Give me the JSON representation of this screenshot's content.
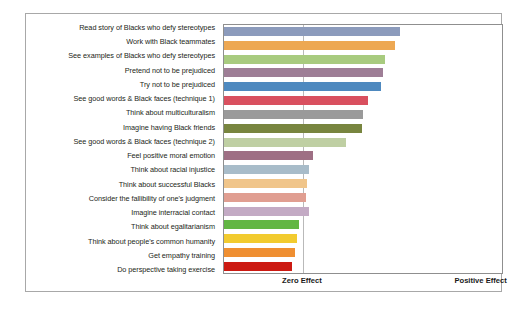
{
  "chart_data": {
    "type": "bar",
    "orientation": "horizontal",
    "title": "",
    "subtitle": "",
    "xlabel": "",
    "ylabel": "",
    "grid": false,
    "legend": null,
    "axis_tick_labels": [
      "Zero Effect",
      "Positive Effect"
    ],
    "axis_tick_positions_pct": [
      28.2,
      92.0
    ],
    "xlim_labels": [
      "Zero Effect",
      "Positive Effect"
    ],
    "zero_line_pct": 28.2,
    "categories": [
      "Read story of Blacks who defy stereotypes",
      "Work with Black teammates",
      "See examples of Blacks who defy stereotypes",
      "Pretend not to be prejudiced",
      "Try not to be prejudiced",
      "See good words & Black faces (technique 1)",
      "Think about multiculturalism",
      "Imagine having Black friends",
      "See good words & Black faces (technique 2)",
      "Feel positive moral emotion",
      "Think about racial injustice",
      "Think about successful Blacks",
      "Consider the fallibility of one's judgment",
      "Imagine interracial contact",
      "Think about egalitarianism",
      "Think about people's common humanity",
      "Get empathy training",
      "Do perspective taking exercise"
    ],
    "values": [
      63.2,
      61.4,
      57.9,
      57.1,
      56.4,
      51.8,
      50.0,
      49.6,
      43.9,
      32.1,
      30.4,
      30.0,
      29.6,
      30.4,
      26.8,
      26.4,
      25.7,
      24.6
    ],
    "colors": [
      "#8c9bbc",
      "#eda853",
      "#a8cb7f",
      "#9e7e96",
      "#4e89bf",
      "#d9505f",
      "#9a9a9a",
      "#78853f",
      "#bfcfa3",
      "#9e6f84",
      "#a8bcc9",
      "#f0c58a",
      "#e09e91",
      "#c3aac4",
      "#62b644",
      "#f2cb2f",
      "#ef8f32",
      "#cc1a12"
    ]
  }
}
